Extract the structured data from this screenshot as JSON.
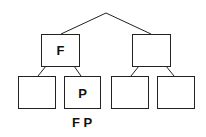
{
  "diagram": {
    "type": "tree",
    "root": {
      "label": "",
      "apex": [
        106,
        13
      ]
    },
    "level1": [
      {
        "id": "left",
        "label": "F",
        "box": [
          41,
          34,
          38,
          32
        ]
      },
      {
        "id": "right",
        "label": "",
        "box": [
          132,
          34,
          38,
          32
        ]
      }
    ],
    "level2": [
      {
        "id": "ll",
        "parent": "left",
        "label": "",
        "box": [
          18,
          76,
          37,
          32
        ]
      },
      {
        "id": "lr",
        "parent": "left",
        "label": "P",
        "box": [
          64,
          76,
          37,
          32
        ]
      },
      {
        "id": "rl",
        "parent": "right",
        "label": "",
        "box": [
          111,
          76,
          38,
          32
        ]
      },
      {
        "id": "rr",
        "parent": "right",
        "label": "",
        "box": [
          157,
          76,
          38,
          32
        ]
      }
    ],
    "caption": "F P"
  }
}
